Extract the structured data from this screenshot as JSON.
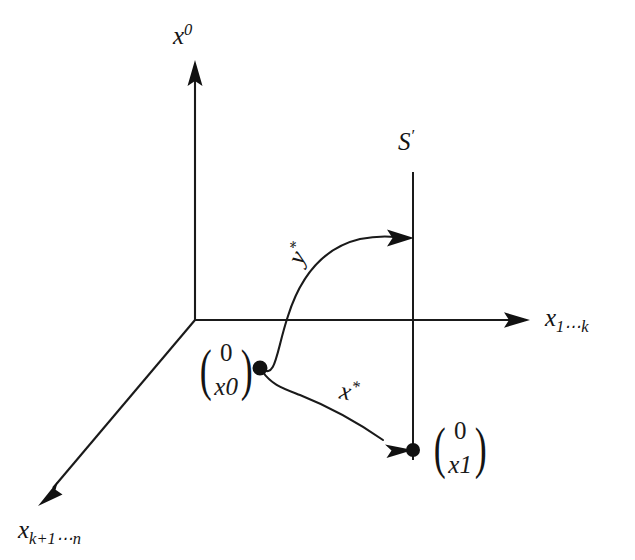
{
  "figure": {
    "type": "commutative-coordinate-diagram",
    "background_color": "#ffffff",
    "stroke_color": "#1a1a1a",
    "axes": [
      {
        "name": "vertical-axis",
        "label_parts": {
          "base": "x",
          "superscript": "0"
        },
        "label_text": "x0",
        "direction": "up",
        "from": [
          195,
          320
        ],
        "to": [
          195,
          62
        ]
      },
      {
        "name": "horizontal-axis",
        "label_parts": {
          "base": "x",
          "subscript": "1⋯k"
        },
        "label_text": "x1⋯k",
        "direction": "right",
        "from": [
          195,
          320
        ],
        "to": [
          528,
          320
        ]
      },
      {
        "name": "diagonal-axis",
        "label_parts": {
          "base": "x",
          "subscript": "k+1⋯n"
        },
        "label_text": "xk+1⋯n",
        "direction": "down-left",
        "from": [
          195,
          320
        ],
        "to": [
          38,
          506
        ]
      }
    ],
    "plane_line": {
      "name": "s-prime-line",
      "label": "S′",
      "label_parts": {
        "base": "S",
        "prime": "′"
      },
      "x": 413,
      "y_top": 172,
      "y_bottom": 460
    },
    "points": [
      {
        "name": "source-point",
        "x": 260,
        "y": 368,
        "vector_label": {
          "top": "0",
          "bottom_base": "x",
          "bottom_sub": "0"
        }
      },
      {
        "name": "target-point",
        "x": 413,
        "y": 450,
        "vector_label": {
          "top": "0",
          "bottom_base": "x",
          "bottom_sub": "1"
        }
      }
    ],
    "arrows": [
      {
        "name": "y-star-arrow",
        "label_base": "y",
        "label_sup": "*",
        "label_text": "y*",
        "from": [
          260,
          368
        ],
        "to": [
          413,
          238
        ],
        "shape": "s-curve-rising"
      },
      {
        "name": "x-star-arrow",
        "label_base": "x",
        "label_sup": "*",
        "label_text": "x*",
        "from": [
          260,
          368
        ],
        "to": [
          413,
          450
        ],
        "shape": "s-curve-falling"
      }
    ]
  }
}
